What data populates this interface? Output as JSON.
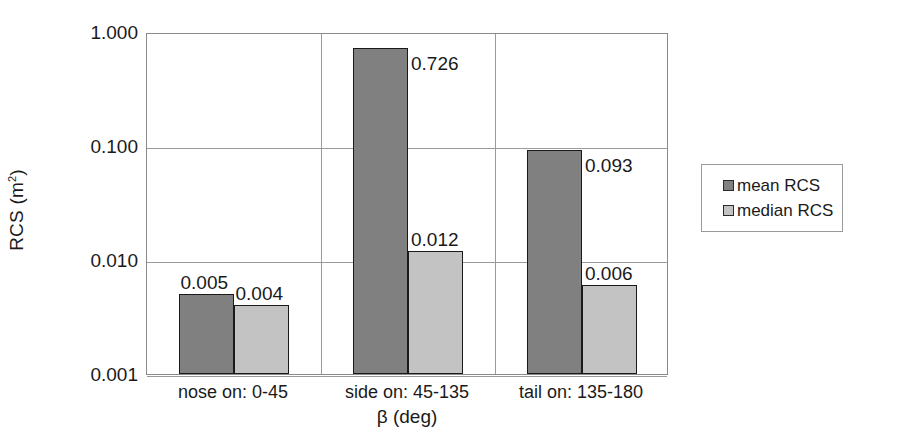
{
  "chart_data": {
    "type": "bar",
    "title": "",
    "subtitle": "",
    "xlabel": "β (deg)",
    "ylabel": "RCS (m²)",
    "ylabel_base": "RCS (m",
    "ylabel_sup": "2",
    "ylabel_tail": ")",
    "yscale": "log",
    "ylim": [
      0.001,
      1.0
    ],
    "grid": "horizontal-and-category-separators",
    "legend_position": "right",
    "categories": [
      "nose on:  0-45",
      "side on: 45-135",
      "tail on: 135-180"
    ],
    "ytick_labels": [
      "1.000",
      "0.100",
      "0.010",
      "0.001"
    ],
    "ytick_values": [
      1.0,
      0.1,
      0.01,
      0.001
    ],
    "series": [
      {
        "name": "mean RCS",
        "color": "#808080",
        "values": [
          0.005,
          0.726,
          0.093
        ],
        "labels": [
          "0.005",
          "0.726",
          "0.093"
        ]
      },
      {
        "name": "median RCS",
        "color": "#c3c3c3",
        "values": [
          0.004,
          0.012,
          0.006
        ],
        "labels": [
          "0.004",
          "0.012",
          "0.006"
        ]
      }
    ]
  },
  "legend": {
    "items": [
      {
        "label": "mean RCS",
        "swatch": "mean"
      },
      {
        "label": "median RCS",
        "swatch": "median"
      }
    ]
  },
  "colors": {
    "mean_bar": "#808080",
    "median_bar": "#c3c3c3",
    "bar_outline": "#1a1a1a",
    "gridline": "#9a9a9a",
    "text": "#1a1a1a",
    "background": "#ffffff"
  }
}
